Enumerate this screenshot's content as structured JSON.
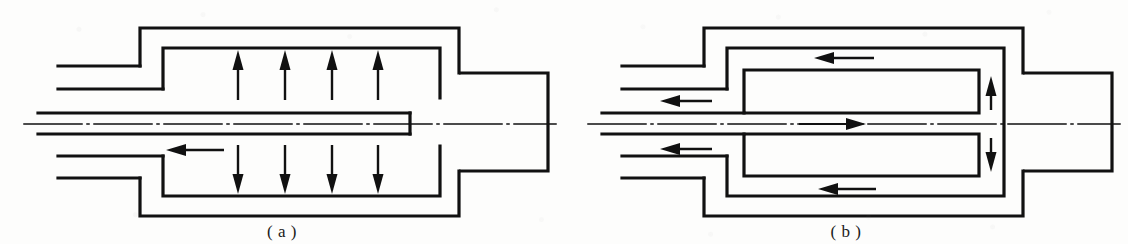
{
  "figure": {
    "background_color": "#fdfdfc",
    "line_color": "#111111",
    "panel_count": 2
  },
  "panels": [
    {
      "id": "a",
      "caption": "( a )",
      "description": "Draft-tube type: central feed tube discharges near the closed end; annulus flow rises and falls vertically",
      "flow_arrows": {
        "up_count": 4,
        "down_count": 4,
        "horizontal_count": 1,
        "up_label": "upward circulation",
        "down_label": "downward circulation",
        "outlet_label": "outlet flow to the left"
      },
      "components": {
        "outer_shell_label": "outer shell",
        "inner_shell_label": "inner shell",
        "center_tube_label": "central feed tube",
        "upper_port_label": "upper inlet port",
        "lower_port_label": "lower outlet port",
        "end_stub_label": "right end connection stub",
        "centerline_label": "axis centerline"
      }
    },
    {
      "id": "b",
      "caption": "( b )",
      "description": "Baffled double-pass type: central jet travels to the right end, turns at the far wall and returns along upper and lower channels",
      "flow_arrows": {
        "left_count": 4,
        "right_count": 1,
        "up_count": 1,
        "down_count": 1,
        "jet_label": "central jet flowing right",
        "return_label": "return flow to the left",
        "turn_up_label": "flow turning upward at far end",
        "turn_down_label": "flow turning downward at far end"
      },
      "components": {
        "outer_shell_label": "outer shell",
        "inner_shell_label": "inner shell",
        "upper_baffle_label": "upper baffle insert",
        "lower_baffle_label": "lower baffle insert",
        "center_tube_label": "central feed tube",
        "upper_port_label": "upper outlet port",
        "lower_port_label": "lower outlet port",
        "end_stub_label": "right end connection stub",
        "centerline_label": "axis centerline"
      }
    }
  ]
}
